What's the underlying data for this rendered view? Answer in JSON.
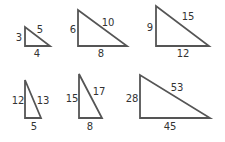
{
  "diagram": {
    "title": "",
    "stroke_color": "#555555",
    "label_color": "#333333",
    "triangles": [
      {
        "id": "t1",
        "vertical": "3",
        "hypotenuse": "5",
        "base": "4",
        "points": "25,27 25,46 50,46",
        "vlabel": [
          19,
          41
        ],
        "hlabel": [
          40,
          33
        ],
        "blabel": [
          37,
          57
        ]
      },
      {
        "id": "t2",
        "vertical": "6",
        "hypotenuse": "10",
        "base": "8",
        "points": "78,10 78,46 127,46",
        "vlabel": [
          73,
          33
        ],
        "hlabel": [
          108,
          26
        ],
        "blabel": [
          101,
          57
        ]
      },
      {
        "id": "t3",
        "vertical": "9",
        "hypotenuse": "15",
        "base": "12",
        "points": "156,6 156,46 209,46",
        "vlabel": [
          150,
          31
        ],
        "hlabel": [
          188,
          20
        ],
        "blabel": [
          183,
          57
        ]
      },
      {
        "id": "t4",
        "vertical": "12",
        "hypotenuse": "13",
        "base": "5",
        "points": "25,80 25,118 41,118",
        "vlabel": [
          18,
          104
        ],
        "hlabel": [
          43,
          104
        ],
        "blabel": [
          34,
          130
        ]
      },
      {
        "id": "t5",
        "vertical": "15",
        "hypotenuse": "17",
        "base": "8",
        "points": "79,74 79,118 102,118",
        "vlabel": [
          72,
          102
        ],
        "hlabel": [
          99,
          95
        ],
        "blabel": [
          90,
          130
        ]
      },
      {
        "id": "t6",
        "vertical": "28",
        "hypotenuse": "53",
        "base": "45",
        "points": "140,75 140,118 210,118",
        "vlabel": [
          132,
          102
        ],
        "hlabel": [
          177,
          91
        ],
        "blabel": [
          170,
          130
        ]
      }
    ]
  }
}
